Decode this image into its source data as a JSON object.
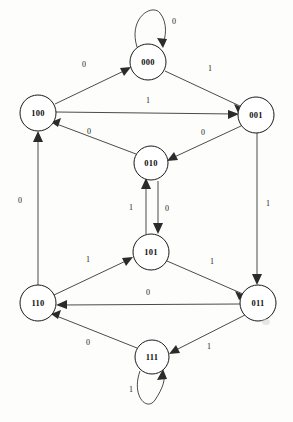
{
  "diagram": {
    "type": "finite-state-machine",
    "background_color": "#fdfdfc",
    "node_stroke_color": "#1a1a1a",
    "edge_color": "#2b2b2b",
    "nodes": [
      {
        "id": "000",
        "label": "000",
        "cx": 148,
        "cy": 62,
        "r": 18
      },
      {
        "id": "100",
        "label": "100",
        "cx": 38,
        "cy": 113,
        "r": 18
      },
      {
        "id": "001",
        "label": "001",
        "cx": 256,
        "cy": 115,
        "r": 18
      },
      {
        "id": "010",
        "label": "010",
        "cx": 151,
        "cy": 163,
        "r": 17
      },
      {
        "id": "101",
        "label": "101",
        "cx": 151,
        "cy": 252,
        "r": 18
      },
      {
        "id": "110",
        "label": "110",
        "cx": 38,
        "cy": 303,
        "r": 18
      },
      {
        "id": "011",
        "label": "011",
        "cx": 258,
        "cy": 303,
        "r": 18
      },
      {
        "id": "111",
        "label": "111",
        "cx": 152,
        "cy": 357,
        "r": 17
      }
    ],
    "edges": [
      {
        "from": "000",
        "to": "000",
        "label": "0",
        "kind": "self-loop",
        "lx": 174,
        "ly": 21
      },
      {
        "from": "100",
        "to": "000",
        "label": "0",
        "kind": "line",
        "lx": 84,
        "ly": 64
      },
      {
        "from": "000",
        "to": "001",
        "label": "1",
        "kind": "line",
        "lx": 210,
        "ly": 68
      },
      {
        "from": "100",
        "to": "001",
        "label": "1",
        "kind": "line",
        "lx": 148,
        "ly": 100
      },
      {
        "from": "010",
        "to": "100",
        "label": "0",
        "kind": "line",
        "lx": 89,
        "ly": 131
      },
      {
        "from": "001",
        "to": "010",
        "label": "0",
        "kind": "line",
        "lx": 203,
        "ly": 132
      },
      {
        "from": "110",
        "to": "100",
        "label": "0",
        "kind": "line",
        "lx": 20,
        "ly": 200
      },
      {
        "from": "101",
        "to": "010",
        "label": "1",
        "kind": "line",
        "lx": 131,
        "ly": 207
      },
      {
        "from": "010",
        "to": "101",
        "label": "0",
        "kind": "line",
        "lx": 167,
        "ly": 208
      },
      {
        "from": "001",
        "to": "011",
        "label": "1",
        "kind": "line",
        "lx": 268,
        "ly": 203
      },
      {
        "from": "110",
        "to": "101",
        "label": "1",
        "kind": "line",
        "lx": 88,
        "ly": 259
      },
      {
        "from": "101",
        "to": "011",
        "label": "1",
        "kind": "line",
        "lx": 212,
        "ly": 261
      },
      {
        "from": "011",
        "to": "110",
        "label": "0",
        "kind": "line",
        "lx": 148,
        "ly": 292
      },
      {
        "from": "111",
        "to": "110",
        "label": "0",
        "kind": "line",
        "lx": 88,
        "ly": 342
      },
      {
        "from": "011",
        "to": "111",
        "label": "1",
        "kind": "line",
        "lx": 209,
        "ly": 346
      },
      {
        "from": "111",
        "to": "111",
        "label": "1",
        "kind": "self-loop",
        "lx": 131,
        "ly": 389
      }
    ]
  }
}
